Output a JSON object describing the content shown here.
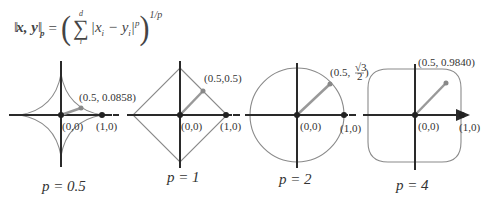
{
  "formula": {
    "lhs": "x, y",
    "lhs_sub": "p",
    "equals": "=",
    "sum_upper": "d",
    "sum_lower": "i",
    "term": "|x",
    "term_sub1": "i",
    "minus": " − y",
    "term_sub2": "i",
    "term_close": "|",
    "term_exp": "p",
    "outer_exp": "1/p"
  },
  "panels": [
    {
      "p_label": "p = 0.5",
      "origin_label": "(0,0)",
      "unit_label": "(1,0)",
      "point_label": "(0.5, 0.0858)",
      "point": [
        0.5,
        0.0858
      ]
    },
    {
      "p_label": "p = 1",
      "origin_label": "(0,0)",
      "unit_label": "(1,0)",
      "point_label": "(0.5,0.5)",
      "point": [
        0.5,
        0.5
      ]
    },
    {
      "p_label": "p = 2",
      "origin_label": "(0,0)",
      "unit_label": "(1,0)",
      "point_label_prefix": "(0.5,",
      "point_label_num": "√3",
      "point_label_den": "2",
      "point_label_suffix": ")",
      "point": [
        0.5,
        0.866
      ]
    },
    {
      "p_label": "p = 4",
      "origin_label": "(0,0)",
      "unit_label": "(1,0)",
      "point_label": "(0.5, 0.9840)",
      "point": [
        0.5,
        0.984
      ]
    }
  ],
  "colors": {
    "axis": "#2a2a2a",
    "curve": "#8a8a8a",
    "vector": "#999999",
    "text": "#333333"
  }
}
